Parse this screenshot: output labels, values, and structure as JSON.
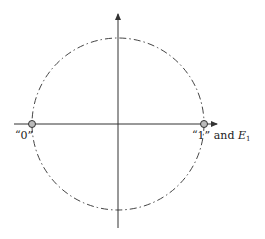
{
  "diagram": {
    "type": "unit-circle-states",
    "label_zero": "“0”",
    "label_one": "“1” and ",
    "label_energy_symbol": "E",
    "label_energy_subscript": "1",
    "colors": {
      "axis": "#333333",
      "circle": "#444444",
      "point_fill": "#bbbbbb",
      "point_stroke": "#333333"
    }
  }
}
